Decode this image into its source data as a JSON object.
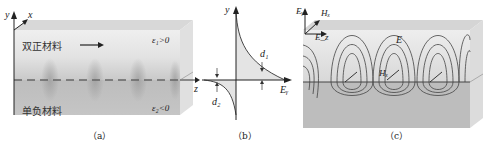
{
  "figure": {
    "panels": [
      {
        "id": "a",
        "caption": "（a）",
        "axes": {
          "y": "y",
          "x": "x",
          "z": "z"
        },
        "upper_region_label": "双正材料",
        "upper_region_condition": "ε₁>0",
        "lower_region_label": "单负材料",
        "lower_region_condition": "ε₂<0",
        "propagation_arrow": "→"
      },
      {
        "id": "b",
        "caption": "（b）",
        "y_axis_label": "y",
        "x_axis_label": "Eᵧ",
        "decay_label_upper": "d₁",
        "decay_label_lower": "d₂"
      },
      {
        "id": "c",
        "caption": "（c）",
        "axis_labels": {
          "vertical": "Eᵧ",
          "diagonal": "Hₓ",
          "horizontal": "E_z"
        },
        "field_label_E": "E",
        "field_label_H": "Hₓ"
      }
    ],
    "colors": {
      "upper_material": "#e6e6e6",
      "lower_material": "#b8b8b8",
      "interface": "#555555",
      "fill_curve": "#e4e4e4"
    }
  }
}
